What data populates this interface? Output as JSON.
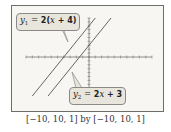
{
  "chart_data": {
    "type": "line",
    "title": "",
    "xlabel": "",
    "ylabel": "",
    "xlim": [
      -10,
      10
    ],
    "ylim": [
      -10,
      10
    ],
    "xscale": 1,
    "yscale": 1,
    "grid": false,
    "window_caption": "[−10, 10, 1] by [−10, 10, 1]",
    "series": [
      {
        "name": "y1",
        "label": "y₁ = 2(x + 4)",
        "equation": "y = 2x + 8",
        "slope": 2,
        "intercept": 8
      },
      {
        "name": "y2",
        "label": "y₂ = 2x + 3",
        "equation": "y = 2x + 3",
        "slope": 2,
        "intercept": 3
      }
    ]
  },
  "labels": {
    "y1_var": "y",
    "y1_sub": "1",
    "y1_rhs": " = ",
    "y1_expr_a": "2(",
    "y1_expr_x": "x",
    "y1_expr_b": " + 4)",
    "y2_var": "y",
    "y2_sub": "2",
    "y2_rhs": " = ",
    "y2_expr_a": "2",
    "y2_expr_x": "x",
    "y2_expr_b": " + 3"
  },
  "caption": "[−10, 10, 1] by [−10, 10, 1]",
  "colors": {
    "line": "#555555",
    "axis": "#777777",
    "frame": "#6d6d6d",
    "callout_bg": "#e8e6dc"
  }
}
